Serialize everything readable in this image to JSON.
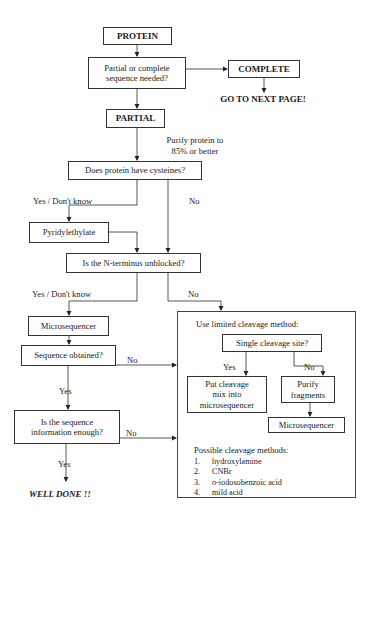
{
  "nodes": {
    "protein": "PROTEIN",
    "partial_or_complete": [
      "Partial or complete",
      "sequence needed?"
    ],
    "complete": "COMPLETE",
    "go_next_page": "GO TO NEXT PAGE!",
    "partial": "PARTIAL",
    "purify_note": [
      "Purify protein to",
      "85% or better"
    ],
    "cysteines": "Does protein have cysteines?",
    "pyridylethylate": "Pyridylethylate",
    "n_terminus": "Is the N-terminus unblocked?",
    "microsequencer": "Microsequencer",
    "sequence_obtained": "Sequence obtained?",
    "sequence_enough": [
      "Is the sequence",
      "information enough?"
    ],
    "well_done": "WELL DONE !!",
    "cleavage_box": {
      "title": "Use limited cleavage method:",
      "single_site": "Single cleavage site?",
      "put_cleavage": [
        "Put cleavage",
        "mix into",
        "microsequencer"
      ],
      "purify_fragments": [
        "Purify",
        "fragments"
      ],
      "microsequencer": "Microsequencer",
      "methods_title": "Possible cleavage methods:",
      "methods": [
        {
          "num": "1.",
          "prefix": "",
          "text": "hydroxylamine"
        },
        {
          "num": "2.",
          "prefix": "",
          "text": "CNBr"
        },
        {
          "num": "3.",
          "prefix": "o",
          "text": "-iodosobenzoic acid"
        },
        {
          "num": "4.",
          "prefix": "",
          "text": "mild acid"
        }
      ]
    }
  },
  "edge_labels": {
    "cys_yes": "Yes / Don't know",
    "cys_no": "No",
    "nterm_yes": "Yes / Don't know",
    "nterm_no": "No",
    "seq_obtained_no": "No",
    "seq_obtained_yes": "Yes",
    "seq_enough_no": "No",
    "seq_enough_yes": "Yes",
    "single_yes": "Yes",
    "single_no": "No"
  }
}
